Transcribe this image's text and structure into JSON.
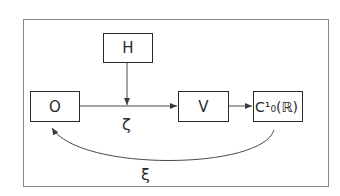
{
  "diagram": {
    "type": "commutative-flow",
    "nodes": [
      {
        "id": "H",
        "label": "H"
      },
      {
        "id": "O",
        "label": "O"
      },
      {
        "id": "V",
        "label": "V"
      },
      {
        "id": "C",
        "label": "C¹₀(ℝ)"
      }
    ],
    "edges": [
      {
        "from": "O",
        "to": "V",
        "label": "ζ"
      },
      {
        "from": "H",
        "to": "O-V edge",
        "label": ""
      },
      {
        "from": "V",
        "to": "C",
        "label": ""
      },
      {
        "from": "C",
        "to": "O",
        "label": "ξ"
      }
    ],
    "edge_labels": {
      "zeta": "ζ",
      "xi": "ξ"
    },
    "colors": {
      "stroke": "#2a2a2a",
      "frame": "#8a8a8a",
      "background": "#ffffff"
    }
  }
}
